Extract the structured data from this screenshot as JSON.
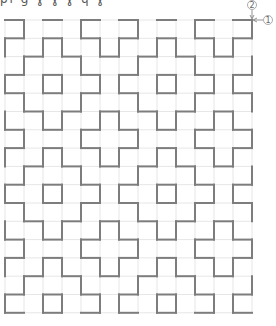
{
  "caption": "pı ɡ ɣ ɣ ɣ ɥ ɣ",
  "grid": {
    "origin_x": 5,
    "origin_y": 20,
    "cols": 13,
    "rows": 16,
    "cell_w": 19,
    "cell_h": 18.3,
    "grid_color": "#e6e6e6",
    "stitch_color": "#7d7d7d",
    "period": 6,
    "horizontal_rule": {
      "rows_mod_a": [
        0,
        1,
        3,
        4
      ],
      "cols_a": [
        0,
        2,
        4
      ],
      "rows_mod_b": [
        2,
        5
      ],
      "cols_b": [
        1,
        3,
        5
      ]
    },
    "vertical_rule": {
      "cols_mod_a": [
        0,
        2,
        3,
        5
      ],
      "rows_a": [
        1,
        3,
        5
      ],
      "cols_mod_b": [
        1,
        4
      ],
      "rows_b": [
        0,
        2,
        4
      ]
    }
  },
  "annotations": [
    {
      "label": "2",
      "x": 252,
      "y": 5,
      "arrow": "down"
    },
    {
      "label": "1",
      "x": 268,
      "y": 20,
      "arrow": "left"
    }
  ]
}
